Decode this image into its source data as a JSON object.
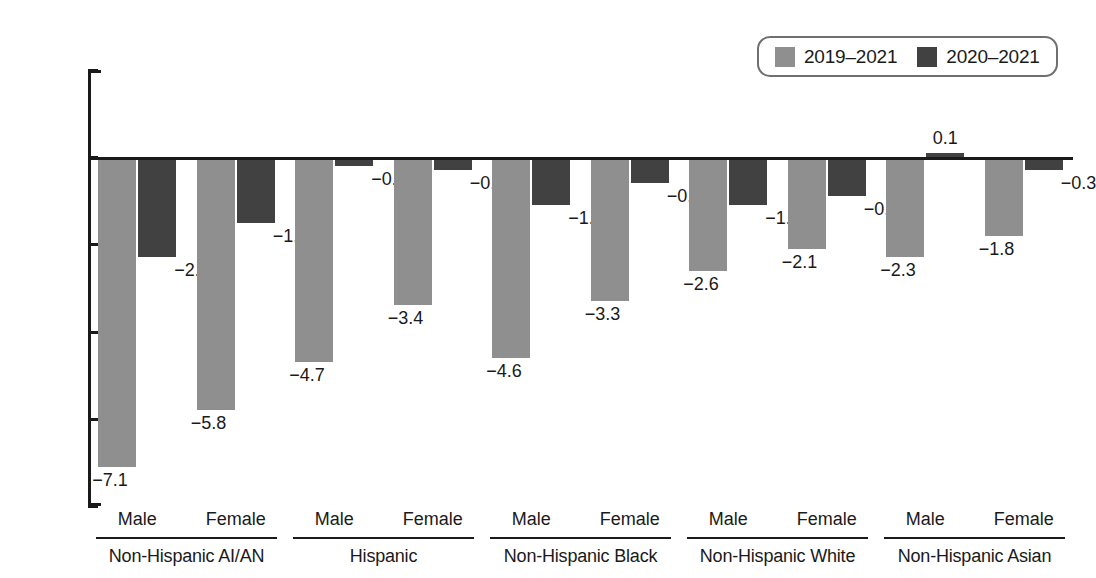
{
  "chart_data": {
    "type": "bar",
    "title": "",
    "xlabel": "",
    "ylabel": "Change (years)",
    "ylim": [
      -8,
      2
    ],
    "yticks": [
      2,
      0,
      -2,
      -4,
      -6,
      -8
    ],
    "ytick_labels": [
      "2",
      "0",
      "−2",
      "−4",
      "−6",
      "−8"
    ],
    "grid": false,
    "legend_position": "top-right",
    "categories": [
      "Non-Hispanic AI/AN Male",
      "Non-Hispanic AI/AN Female",
      "Hispanic Male",
      "Hispanic Female",
      "Non-Hispanic Black Male",
      "Non-Hispanic Black Female",
      "Non-Hispanic White Male",
      "Non-Hispanic White Female",
      "Non-Hispanic Asian Male",
      "Non-Hispanic Asian Female"
    ],
    "series": [
      {
        "name": "2019–2021",
        "color": "#8f8f8f",
        "values": [
          -7.1,
          -5.8,
          -4.7,
          -3.4,
          -4.6,
          -3.3,
          -2.6,
          -2.1,
          -2.3,
          -1.8
        ],
        "labels": [
          "−7.1",
          "−5.8",
          "−4.7",
          "−3.4",
          "−4.6",
          "−3.3",
          "−2.6",
          "−2.1",
          "−2.3",
          "−1.8"
        ]
      },
      {
        "name": "2020–2021",
        "color": "#414141",
        "values": [
          -2.3,
          -1.5,
          -0.2,
          -0.3,
          -1.1,
          -0.6,
          -1.1,
          -0.9,
          0.1,
          -0.3
        ],
        "labels": [
          "−2.3",
          "−1.5",
          "−0.2",
          "−0.3",
          "−1.1",
          "−0.6",
          "−1.1",
          "−0.9",
          "0.1",
          "−0.3"
        ]
      }
    ],
    "groups": [
      {
        "name": "Non-Hispanic AI/AN",
        "sexes": [
          "Male",
          "Female"
        ]
      },
      {
        "name": "Hispanic",
        "sexes": [
          "Male",
          "Female"
        ]
      },
      {
        "name": "Non-Hispanic Black",
        "sexes": [
          "Male",
          "Female"
        ]
      },
      {
        "name": "Non-Hispanic White",
        "sexes": [
          "Male",
          "Female"
        ]
      },
      {
        "name": "Non-Hispanic Asian",
        "sexes": [
          "Male",
          "Female"
        ]
      }
    ]
  },
  "legend": {
    "items": [
      {
        "label": "2019–2021",
        "color": "#8f8f8f"
      },
      {
        "label": "2020–2021",
        "color": "#414141"
      }
    ]
  },
  "axis": {
    "y_title": "Change (years)"
  }
}
